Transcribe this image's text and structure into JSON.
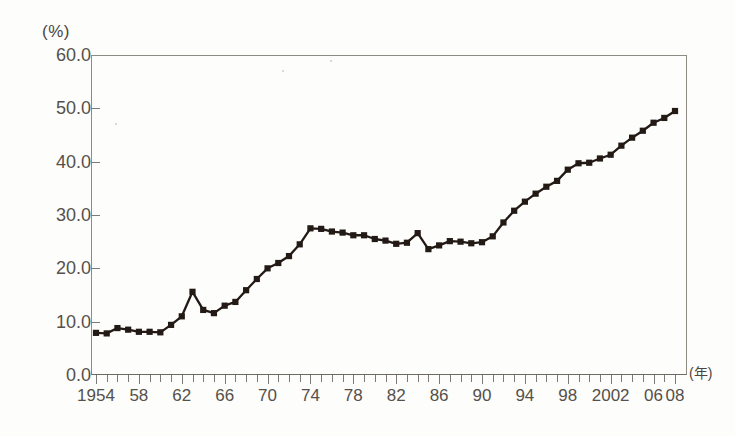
{
  "chart_data": {
    "type": "line",
    "title": "",
    "subtitle": "",
    "xlabel": "(年)",
    "ylabel": "(%)",
    "xlim": [
      1954,
      2008
    ],
    "ylim": [
      0.0,
      60.0
    ],
    "y_ticks": [
      "0.0",
      "10.0",
      "20.0",
      "30.0",
      "40.0",
      "50.0",
      "60.0"
    ],
    "y_tick_values": [
      0,
      10,
      20,
      30,
      40,
      50,
      60
    ],
    "x_tick_labels": [
      "1954",
      "58",
      "62",
      "66",
      "70",
      "74",
      "78",
      "82",
      "86",
      "90",
      "94",
      "98",
      "2002",
      "06",
      "08"
    ],
    "x_tick_label_years": [
      1954,
      1958,
      1962,
      1966,
      1970,
      1974,
      1978,
      1982,
      1986,
      1990,
      1994,
      1998,
      2002,
      2006,
      2008
    ],
    "x_minor_tick_interval": 1,
    "grid": false,
    "legend": "none",
    "marker": "square",
    "marker_color": "#231a16",
    "line_color": "#231a16",
    "x": [
      1954,
      1955,
      1956,
      1957,
      1958,
      1959,
      1960,
      1961,
      1962,
      1963,
      1964,
      1965,
      1966,
      1967,
      1968,
      1969,
      1970,
      1971,
      1972,
      1973,
      1974,
      1975,
      1976,
      1977,
      1978,
      1979,
      1980,
      1981,
      1982,
      1983,
      1984,
      1985,
      1986,
      1987,
      1988,
      1989,
      1990,
      1991,
      1992,
      1993,
      1994,
      1995,
      1996,
      1997,
      1998,
      1999,
      2000,
      2001,
      2002,
      2003,
      2004,
      2005,
      2006,
      2007,
      2008
    ],
    "values": [
      7.9,
      7.8,
      8.8,
      8.5,
      8.1,
      8.1,
      8.0,
      9.4,
      11.0,
      15.6,
      12.2,
      11.6,
      13.0,
      13.7,
      15.9,
      18.0,
      20.0,
      21.0,
      22.3,
      24.5,
      27.5,
      27.4,
      26.9,
      26.7,
      26.2,
      26.2,
      25.5,
      25.2,
      24.6,
      24.8,
      26.6,
      23.6,
      24.3,
      25.1,
      25.0,
      24.7,
      24.9,
      26.0,
      28.6,
      30.8,
      32.5,
      34.0,
      35.3,
      36.4,
      38.5,
      39.7,
      39.8,
      40.6,
      41.3,
      43.0,
      44.5,
      45.8,
      47.3,
      48.2,
      49.5
    ],
    "series": [
      {
        "name": "series-1",
        "values": [
          7.9,
          7.8,
          8.8,
          8.5,
          8.1,
          8.1,
          8.0,
          9.4,
          11.0,
          15.6,
          12.2,
          11.6,
          13.0,
          13.7,
          15.9,
          18.0,
          20.0,
          21.0,
          22.3,
          24.5,
          27.5,
          27.4,
          26.9,
          26.7,
          26.2,
          26.2,
          25.5,
          25.2,
          24.6,
          24.8,
          26.6,
          23.6,
          24.3,
          25.1,
          25.0,
          24.7,
          24.9,
          26.0,
          28.6,
          30.8,
          32.5,
          34.0,
          35.3,
          36.4,
          38.5,
          39.7,
          39.8,
          40.6,
          41.3,
          43.0,
          44.5,
          45.8,
          47.3,
          48.2,
          49.5
        ]
      }
    ],
    "annotations": []
  }
}
